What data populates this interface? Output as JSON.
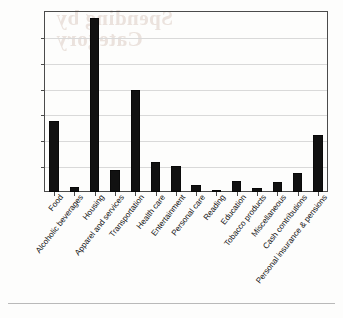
{
  "chart_data": {
    "type": "bar",
    "title": "",
    "subtitle": "",
    "xlabel": "",
    "ylabel": "",
    "ylim": [
      0,
      14000
    ],
    "ytick_step": 2000,
    "grid": true,
    "legend": false,
    "legend_position": "none",
    "categories": [
      "Food",
      "Alcoholic beverages",
      "Housing",
      "Apparel and services",
      "Transportation",
      "Health care",
      "Entertainment",
      "Personal care",
      "Reading",
      "Education",
      "Tobacco products",
      "Miscellaneous",
      "Cash contributions",
      "Personal insurance & pensions"
    ],
    "values": [
      5500,
      400,
      13450,
      1700,
      7900,
      2350,
      2050,
      580,
      140,
      850,
      320,
      790,
      1450,
      4400
    ],
    "ytick_labels": [
      "$0",
      "$2,000",
      "$4,000",
      "$6,000",
      "$8,000",
      "$10,000",
      "$12,000",
      "$14,000"
    ],
    "ytick_values": [
      0,
      2000,
      4000,
      6000,
      8000,
      10000,
      12000,
      14000
    ],
    "bar_color": "#111111",
    "grid_color": "#d9d9d9",
    "axis_color": "#4b4b4b"
  },
  "page": {
    "bleed_line1": "Spending by",
    "bleed_line2": "Category"
  }
}
